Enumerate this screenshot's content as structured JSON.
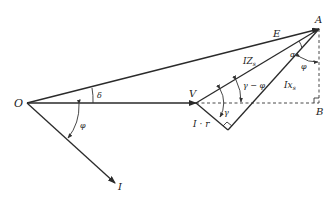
{
  "diagram": {
    "type": "phasor-diagram",
    "points": {
      "O": "O",
      "V": "V",
      "A": "A",
      "B": "B"
    },
    "vectors": {
      "E": "E",
      "I": "I",
      "IZs": {
        "main": "IZ",
        "sub": "s"
      },
      "Ixs": {
        "main": "Ix",
        "sub": "s"
      },
      "Ir": "I · r"
    },
    "angles": {
      "delta": "δ",
      "phi_left": "φ",
      "phi_right": "φ",
      "gamma": "γ",
      "gamma_minus_phi": "γ − φ",
      "alpha": "α"
    },
    "colors": {
      "line": "#2a2a2a",
      "background": "#ffffff"
    }
  }
}
